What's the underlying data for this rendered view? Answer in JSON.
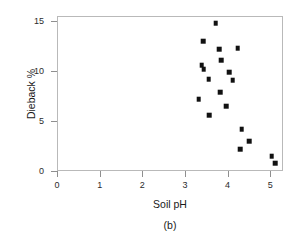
{
  "figure": {
    "caption": "(b)",
    "background_color": "#ffffff",
    "frame_color": "#b9b9b9",
    "point_color": "#111111"
  },
  "chart_data": {
    "type": "scatter",
    "title": "",
    "xlabel": "Soil pH",
    "ylabel": "Dieback %",
    "xlim": [
      0,
      5.3
    ],
    "ylim": [
      0,
      15.5
    ],
    "xticks": [
      0,
      1,
      2,
      3,
      4,
      5
    ],
    "xtick_labels": [
      "0",
      "1",
      "2",
      "3",
      "4",
      "5"
    ],
    "yticks": [
      0,
      5,
      10,
      15
    ],
    "ytick_labels": [
      "0",
      "5",
      "10",
      "15"
    ],
    "grid": false,
    "legend": "none",
    "marker": "filled-square",
    "points": [
      {
        "x": 3.7,
        "y": 14.9
      },
      {
        "x": 3.4,
        "y": 13.1
      },
      {
        "x": 3.78,
        "y": 12.3
      },
      {
        "x": 4.21,
        "y": 12.4
      },
      {
        "x": 3.37,
        "y": 10.7
      },
      {
        "x": 3.42,
        "y": 10.3
      },
      {
        "x": 3.83,
        "y": 11.2
      },
      {
        "x": 4.02,
        "y": 10.0
      },
      {
        "x": 3.53,
        "y": 9.3
      },
      {
        "x": 4.1,
        "y": 9.2
      },
      {
        "x": 3.8,
        "y": 8.0
      },
      {
        "x": 3.3,
        "y": 7.3
      },
      {
        "x": 3.95,
        "y": 6.6
      },
      {
        "x": 3.55,
        "y": 5.7
      },
      {
        "x": 4.31,
        "y": 4.3
      },
      {
        "x": 4.48,
        "y": 3.1
      },
      {
        "x": 4.27,
        "y": 2.3
      },
      {
        "x": 5.01,
        "y": 1.6
      },
      {
        "x": 5.1,
        "y": 0.9
      }
    ]
  }
}
